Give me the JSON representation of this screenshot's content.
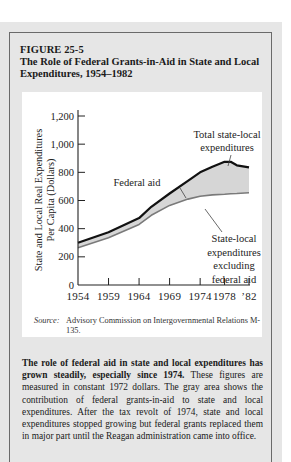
{
  "figure": {
    "number": "FIGURE 25-5",
    "title": "The Role of Federal Grants-in-Aid in State and Local Expenditures, 1954–1982"
  },
  "source": {
    "label": "Source:",
    "text": "Advisory Commission on Intergovernmental Relations M-135."
  },
  "caption": {
    "lead": "The role of federal aid in state and local expenditures has grown steadily, especially since 1974.",
    "body": "These figures are measured in constant 1972 dollars. The gray area shows the contribution of federal grants-in-aid to state and local expenditures. After the tax revolt of 1974, state and local expenditures stopped growing but federal grants replaced them in major part until the Reagan administration came into office."
  },
  "colors": {
    "panel_bg": "#e6e6e6",
    "fill_area": "#d6d6d6",
    "total_line": "#111111",
    "excl_line": "#7a7a7a"
  },
  "chart_data": {
    "type": "area",
    "title": "The Role of Federal Grants-in-Aid in State and Local Expenditures, 1954–1982",
    "xlabel": "",
    "ylabel": "State and Local Real Expenditures Per Capita (Dollars)",
    "ylim": [
      0,
      1200
    ],
    "xlim": [
      1954,
      1982
    ],
    "grid": false,
    "y_ticks": [
      "0",
      "200",
      "400",
      "600",
      "800",
      "1,000",
      "1,200"
    ],
    "y_tick_values": [
      0,
      200,
      400,
      600,
      800,
      1000,
      1200
    ],
    "x_ticks": [
      "1954",
      "1959",
      "1964",
      "1969",
      "1974",
      "1978",
      "’82"
    ],
    "x_tick_values": [
      1954,
      1959,
      1964,
      1969,
      1974,
      1978,
      1982
    ],
    "x": [
      1954,
      1959,
      1964,
      1966,
      1969,
      1972,
      1974,
      1976,
      1978,
      1979,
      1980,
      1982
    ],
    "series": [
      {
        "name": "Total state-local expenditures",
        "values": [
          300,
          375,
          475,
          555,
          650,
          740,
          800,
          840,
          875,
          875,
          850,
          835
        ]
      },
      {
        "name": "State-local expenditures excluding federal aid",
        "values": [
          265,
          335,
          430,
          495,
          565,
          610,
          630,
          640,
          645,
          648,
          650,
          655
        ]
      }
    ],
    "annotations": [
      {
        "text": "Total state-local expenditures",
        "target": "Total state-local expenditures",
        "at_x": 1976
      },
      {
        "text": "Federal aid",
        "target": "shaded area",
        "at_x": 1969
      },
      {
        "text": "State-local expenditures excluding federal aid",
        "target": "State-local expenditures excluding federal aid",
        "at_x": 1975
      }
    ],
    "legend": "none (inline annotations)"
  }
}
